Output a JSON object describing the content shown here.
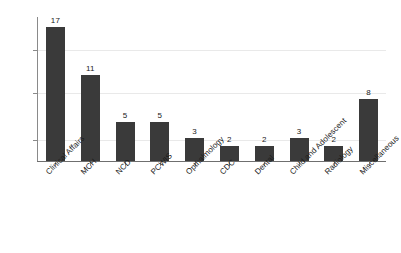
{
  "chart_data": {
    "type": "bar",
    "title": "",
    "subtitle": "",
    "xlabel": "",
    "ylabel": "",
    "categories": [
      "Clinical Affairs",
      "MCH",
      "NCD",
      "PCWIS",
      "Opthalmology",
      "CDC",
      "Dental",
      "Child and Adolescent",
      "Radiology",
      "Miscellaneous"
    ],
    "values": [
      17,
      11,
      5,
      5,
      3,
      2,
      2,
      3,
      2,
      8
    ],
    "value_labels": [
      "17",
      "11",
      "5",
      "5",
      "3",
      "2",
      "2",
      "3",
      "2",
      "8"
    ],
    "ylim": [
      0,
      18.3
    ],
    "xtick_labels_rotation": -45,
    "y_tick_values": [
      5,
      10,
      15
    ],
    "y_tick_labels_visible": false,
    "grid": true,
    "grid_axis": "y",
    "legend": false,
    "legend_position": "none",
    "bar_color": "#3a3a3a",
    "gridline_color": "#e9e9e9",
    "axis_color": "#8a8a8a",
    "background_color": "#ffffff",
    "text_color": "#1a1a1a"
  }
}
